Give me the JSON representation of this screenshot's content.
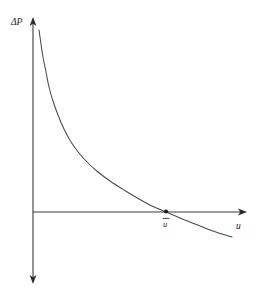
{
  "figure": {
    "type": "line-plot",
    "background_color": "#ffffff",
    "ink_color": "#3a3a3a",
    "text_color": "#1a1a1a"
  },
  "axes": {
    "y_axis": {
      "label": "ΔP",
      "name": "delta-p",
      "arrow_top": true,
      "arrow_bottom": true,
      "x_position": 33,
      "y_top": 18,
      "y_bottom": 283
    },
    "x_axis": {
      "label": "u",
      "name": "u",
      "arrow_right": true,
      "y_position": 212,
      "x_start": 33,
      "x_end": 246
    }
  },
  "annotations": {
    "intersection_point": {
      "label": "u̅",
      "label_plain": "u",
      "has_overbar": true,
      "x": 166,
      "y": 212,
      "marker": "dot"
    }
  },
  "chart_data": {
    "type": "line",
    "title": "",
    "xlabel": "u",
    "ylabel": "ΔP",
    "grid": false,
    "legend": null,
    "axis_origin_pixel": [
      33,
      212
    ],
    "xlim_pixel": [
      33,
      246
    ],
    "ylim_pixel": [
      283,
      18
    ],
    "annotations": [
      {
        "text": "u̅",
        "x_pixel": 166,
        "y_pixel": 212,
        "marker": "dot"
      }
    ],
    "series": [
      {
        "name": "ΔP(u)",
        "description": "monotonically decreasing convex hyperbolic-like curve crossing zero at u-bar",
        "points_pixel": [
          [
            39,
            30
          ],
          [
            41,
            44
          ],
          [
            43,
            57
          ],
          [
            46,
            72
          ],
          [
            49,
            87
          ],
          [
            53,
            101
          ],
          [
            58,
            115
          ],
          [
            64,
            129
          ],
          [
            71,
            142
          ],
          [
            79,
            153
          ],
          [
            88,
            163
          ],
          [
            98,
            172
          ],
          [
            110,
            181
          ],
          [
            124,
            190
          ],
          [
            139,
            199
          ],
          [
            152,
            206
          ],
          [
            166,
            212
          ],
          [
            180,
            218
          ],
          [
            195,
            224
          ],
          [
            210,
            230
          ],
          [
            222,
            234
          ],
          [
            232,
            237
          ]
        ]
      }
    ]
  }
}
